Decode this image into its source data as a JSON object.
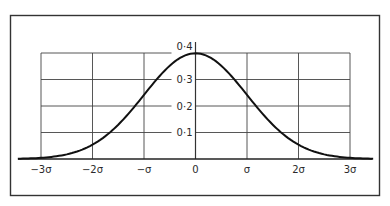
{
  "chart_data": {
    "type": "line",
    "title": "",
    "subtitle": "",
    "xlabel": "",
    "ylabel": "",
    "x_tick_labels": [
      "−3σ",
      "−2σ",
      "−σ",
      "0",
      "σ",
      "2σ",
      "3σ"
    ],
    "x_ticks": [
      -3,
      -2,
      -1,
      0,
      1,
      2,
      3
    ],
    "y_tick_labels": [
      "0·1",
      "0·2",
      "0·3",
      "0·4"
    ],
    "y_ticks": [
      0.1,
      0.2,
      0.3,
      0.4
    ],
    "xlim": [
      -3.5,
      3.5
    ],
    "ylim": [
      0,
      0.4
    ],
    "grid": true,
    "legend": null,
    "series": [
      {
        "name": "normal density",
        "x": [
          -3.5,
          -3,
          -2.5,
          -2,
          -1.5,
          -1,
          -0.5,
          0,
          0.5,
          1,
          1.5,
          2,
          2.5,
          3,
          3.5
        ],
        "y": [
          0.001,
          0.004,
          0.018,
          0.054,
          0.13,
          0.242,
          0.352,
          0.399,
          0.352,
          0.242,
          0.13,
          0.054,
          0.018,
          0.004,
          0.001
        ]
      }
    ]
  }
}
